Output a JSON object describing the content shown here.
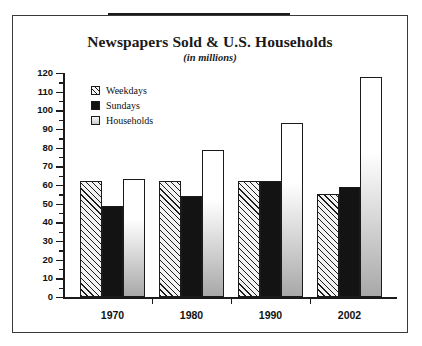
{
  "chart_data": {
    "type": "bar",
    "title": "Newspapers Sold & U.S. Households",
    "subtitle": "(in millions)",
    "xlabel": "",
    "ylabel": "",
    "categories": [
      "1970",
      "1980",
      "1990",
      "2002"
    ],
    "series": [
      {
        "name": "Weekdays",
        "values": [
          62,
          62,
          62,
          55
        ]
      },
      {
        "name": "Sundays",
        "values": [
          49,
          54,
          62,
          59
        ]
      },
      {
        "name": "Households",
        "values": [
          63,
          79,
          93,
          118
        ]
      }
    ],
    "ylim": [
      0,
      120
    ],
    "ytick_step": 10,
    "yticks": [
      0,
      10,
      20,
      30,
      40,
      50,
      60,
      70,
      80,
      90,
      100,
      110,
      120
    ],
    "ytick_labels": [
      "0",
      "10",
      "20",
      "30",
      "40",
      "50",
      "60",
      "70",
      "80",
      "90",
      "100",
      "110",
      "120"
    ],
    "minor_ticks": true,
    "grid": false,
    "legend_position": "upper-left-inside"
  },
  "legend": {
    "items": [
      {
        "label": "Weekdays",
        "swatch": "hatched-diagonal"
      },
      {
        "label": "Sundays",
        "swatch": "solid-black"
      },
      {
        "label": "Households",
        "swatch": "gray-gradient"
      }
    ]
  },
  "colors": {
    "frame": "#3a3a3a",
    "axis": "#1b1b1b",
    "weekdays": "#f2f2f2",
    "sundays": "#131313",
    "households": "#c9c9c9",
    "top_rule": "#1b1b1b"
  }
}
